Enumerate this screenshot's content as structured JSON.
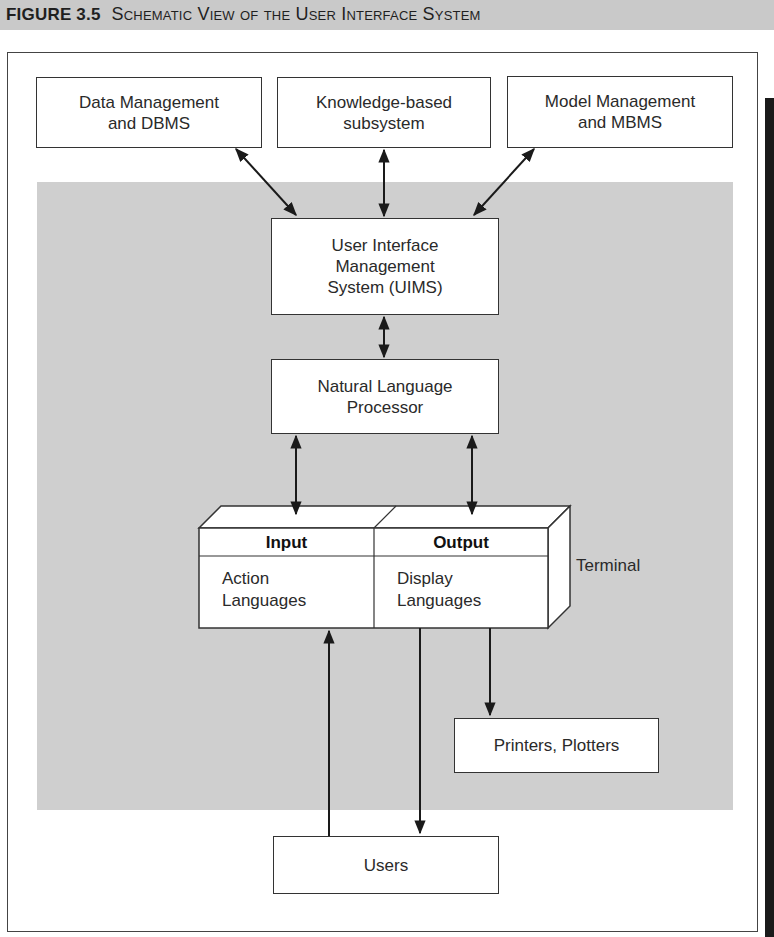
{
  "figure": {
    "number": "FIGURE 3.5",
    "title": "Schematic View of the User Interface System"
  },
  "nodes": {
    "data_management": "Data Management\nand DBMS",
    "knowledge_subsystem": "Knowledge-based\nsubsystem",
    "model_management": "Model Management\nand MBMS",
    "uims": "User Interface\nManagement\nSystem (UIMS)",
    "nlp": "Natural Language\nProcessor",
    "printers": "Printers, Plotters",
    "users": "Users"
  },
  "terminal": {
    "label": "Terminal",
    "input_header": "Input",
    "input_body": "Action\nLanguages",
    "output_header": "Output",
    "output_body": "Display\nLanguages"
  },
  "edges": [
    {
      "from": "data_management",
      "to": "uims",
      "type": "bidirectional"
    },
    {
      "from": "knowledge_subsystem",
      "to": "uims",
      "type": "bidirectional"
    },
    {
      "from": "model_management",
      "to": "uims",
      "type": "bidirectional"
    },
    {
      "from": "uims",
      "to": "nlp",
      "type": "bidirectional"
    },
    {
      "from": "nlp",
      "to": "terminal.input",
      "type": "bidirectional"
    },
    {
      "from": "nlp",
      "to": "terminal.output",
      "type": "bidirectional"
    },
    {
      "from": "users",
      "to": "terminal.input",
      "type": "directed"
    },
    {
      "from": "terminal.output",
      "to": "users",
      "type": "directed"
    },
    {
      "from": "terminal.output",
      "to": "printers",
      "type": "directed"
    }
  ],
  "colors": {
    "caption_bar": "#c9c9c9",
    "panel": "#cfcfcf",
    "line": "#1a1a1a"
  }
}
